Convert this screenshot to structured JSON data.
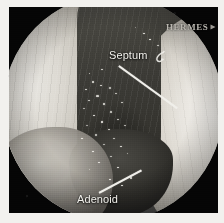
{
  "image": {
    "modality": "nasal endoscopy",
    "view_shape": "circular",
    "plate_background": "#050505",
    "page_background": "#f2f1ee"
  },
  "overlay": {
    "device_text": "HERMES",
    "device_marker_icon": "right-triangle-marker-icon"
  },
  "annotations": [
    {
      "id": "septum",
      "label": "Septum",
      "icon": "curved-hook-arrow-icon",
      "label_x": 100,
      "label_y": 42,
      "leader": {
        "x": 110,
        "y": 58,
        "length": 72,
        "angle": 36
      }
    },
    {
      "id": "adenoid",
      "label": "Adenoid",
      "label_x": 68,
      "label_y": 186,
      "leader": {
        "x": 90,
        "y": 185,
        "length": 48,
        "angle": -28
      }
    }
  ],
  "anatomy": [
    {
      "name": "left-turbinate-mass",
      "tone": "bright"
    },
    {
      "name": "right-turbinate-mass",
      "tone": "bright"
    },
    {
      "name": "nasal-septum-channel",
      "tone": "dark"
    },
    {
      "name": "adenoid-pad",
      "tone": "dark"
    },
    {
      "name": "nasopharynx-vault",
      "tone": "mid"
    }
  ],
  "specks": [
    [
      95,
      74,
      2.2,
      1.6
    ],
    [
      103,
      78,
      1.8,
      1.4
    ],
    [
      88,
      82,
      1.6,
      1.3
    ],
    [
      112,
      80,
      2.0,
      1.5
    ],
    [
      99,
      88,
      2.6,
      1.7
    ],
    [
      91,
      93,
      1.7,
      1.3
    ],
    [
      118,
      86,
      1.5,
      1.2
    ],
    [
      106,
      96,
      2.1,
      1.5
    ],
    [
      86,
      101,
      1.9,
      1.4
    ],
    [
      124,
      95,
      1.6,
      1.2
    ],
    [
      113,
      104,
      2.3,
      1.6
    ],
    [
      96,
      108,
      1.5,
      1.2
    ],
    [
      104,
      114,
      2.0,
      1.5
    ],
    [
      120,
      112,
      1.7,
      1.3
    ],
    [
      89,
      118,
      1.6,
      1.2
    ],
    [
      111,
      122,
      1.9,
      1.4
    ],
    [
      127,
      118,
      1.5,
      1.1
    ],
    [
      98,
      127,
      2.2,
      1.5
    ],
    [
      116,
      131,
      1.7,
      1.3
    ],
    [
      84,
      131,
      1.5,
      1.2
    ],
    [
      106,
      137,
      1.8,
      1.3
    ],
    [
      123,
      139,
      1.6,
      1.2
    ],
    [
      95,
      144,
      1.5,
      1.2
    ],
    [
      113,
      149,
      1.9,
      1.4
    ],
    [
      130,
      146,
      1.4,
      1.1
    ],
    [
      101,
      155,
      1.6,
      1.2
    ],
    [
      120,
      160,
      1.8,
      1.3
    ],
    [
      92,
      162,
      1.4,
      1.1
    ],
    [
      133,
      170,
      2.4,
      1.8
    ],
    [
      112,
      172,
      1.7,
      1.3
    ],
    [
      124,
      178,
      1.5,
      1.2
    ],
    [
      146,
      26,
      1.8,
      1.3
    ],
    [
      152,
      32,
      1.5,
      1.2
    ],
    [
      138,
      20,
      1.4,
      1.1
    ],
    [
      160,
      38,
      2.0,
      1.4
    ],
    [
      166,
      44,
      1.5,
      1.2
    ],
    [
      104,
      62,
      1.5,
      1.2
    ],
    [
      92,
      66,
      1.4,
      1.1
    ]
  ]
}
